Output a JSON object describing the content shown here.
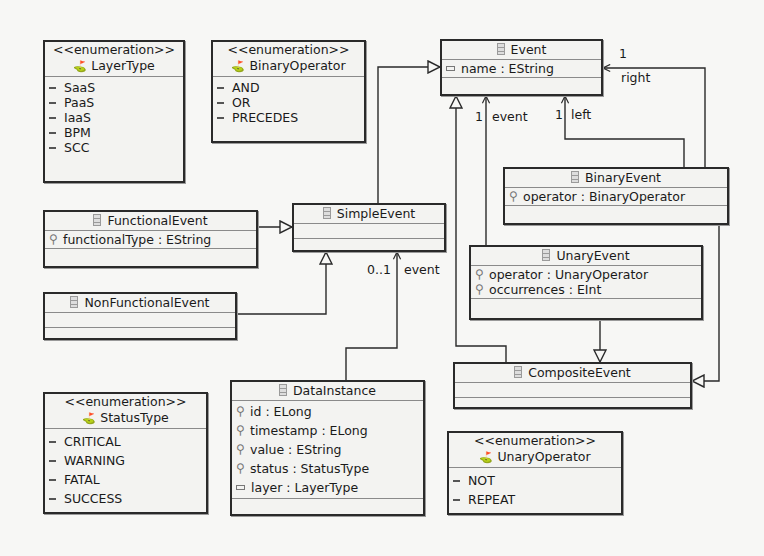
{
  "diagram": {
    "type": "UML class diagram (Ecore)",
    "enumerations": {
      "layer_type": {
        "stereotype": "<<enumeration>>",
        "name": "LayerType",
        "literals": [
          "SaaS",
          "PaaS",
          "IaaS",
          "BPM",
          "SCC"
        ]
      },
      "binary_operator": {
        "stereotype": "<<enumeration>>",
        "name": "BinaryOperator",
        "literals": [
          "AND",
          "OR",
          "PRECEDES"
        ]
      },
      "status_type": {
        "stereotype": "<<enumeration>>",
        "name": "StatusType",
        "literals": [
          "CRITICAL",
          "WARNING",
          "FATAL",
          "SUCCESS"
        ]
      },
      "unary_operator": {
        "stereotype": "<<enumeration>>",
        "name": "UnaryOperator",
        "literals": [
          "NOT",
          "REPEAT"
        ]
      }
    },
    "classes": {
      "event": {
        "name": "Event",
        "attributes": [
          "name : EString"
        ]
      },
      "functional_event": {
        "name": "FunctionalEvent",
        "attributes": [
          "functionalType : EString"
        ]
      },
      "simple_event": {
        "name": "SimpleEvent",
        "attributes": []
      },
      "non_functional_event": {
        "name": "NonFunctionalEvent",
        "attributes": []
      },
      "binary_event": {
        "name": "BinaryEvent",
        "attributes": [
          "operator : BinaryOperator"
        ]
      },
      "unary_event": {
        "name": "UnaryEvent",
        "attributes": [
          "operator : UnaryOperator",
          "occurrences : EInt"
        ]
      },
      "composite_event": {
        "name": "CompositeEvent",
        "attributes": []
      },
      "data_instance": {
        "name": "DataInstance",
        "attributes": [
          "id : ELong",
          "timestamp : ELong",
          "value : EString",
          "status : StatusType",
          "layer : LayerType"
        ]
      }
    },
    "association_labels": {
      "binary_right_mult": "1",
      "binary_right_role": "right",
      "binary_left_mult": "1",
      "binary_left_role": "left",
      "unary_event_mult": "1",
      "unary_event_role": "event",
      "data_event_mult": "0..1",
      "data_event_role": "event"
    },
    "colors": {
      "line": "#2a2a2a",
      "box_fill": "#f3f3f1",
      "background": "#f7f7f5"
    }
  }
}
